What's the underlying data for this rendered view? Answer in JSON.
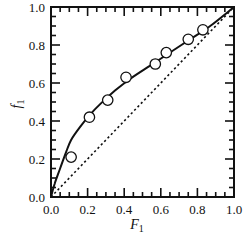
{
  "chart_data": {
    "type": "scatter",
    "title": "",
    "xlabel": "F1",
    "ylabel": "f1",
    "xlabel_main": "F",
    "xlabel_sub": "1",
    "ylabel_main": "f",
    "ylabel_sub": "1",
    "xlim": [
      0.0,
      1.0
    ],
    "ylim": [
      0.0,
      1.0
    ],
    "grid": false,
    "legend": null,
    "ticks": {
      "major_step": 0.2,
      "minor_step": 0.05,
      "direction": "in",
      "mirror": true
    },
    "x_tick_labels": [
      "0.0",
      "0.2",
      "0.4",
      "0.6",
      "0.8",
      "1.0"
    ],
    "y_tick_labels": [
      "0.0",
      "0.2",
      "0.4",
      "0.6",
      "0.8",
      "1.0"
    ],
    "series": [
      {
        "name": "Experimental data",
        "kind": "markers",
        "marker": "open-circle",
        "x": [
          0.11,
          0.21,
          0.31,
          0.41,
          0.57,
          0.63,
          0.75,
          0.83
        ],
        "y": [
          0.21,
          0.42,
          0.51,
          0.63,
          0.7,
          0.76,
          0.83,
          0.88
        ]
      },
      {
        "name": "Fitted composition curve",
        "kind": "line",
        "style": "solid",
        "x": [
          0.0,
          0.02,
          0.05,
          0.08,
          0.11,
          0.16,
          0.21,
          0.27,
          0.35,
          0.43,
          0.54,
          0.65,
          0.76,
          0.87,
          1.0
        ],
        "y": [
          0.0,
          0.07,
          0.15,
          0.23,
          0.3,
          0.37,
          0.43,
          0.49,
          0.56,
          0.62,
          0.69,
          0.76,
          0.83,
          0.9,
          1.0
        ]
      },
      {
        "name": "Ideal (azeotropic) line f1 = F1",
        "kind": "line",
        "style": "dotted",
        "x": [
          0.0,
          1.0
        ],
        "y": [
          0.0,
          1.0
        ]
      }
    ]
  },
  "colors": {
    "ink": "#111111",
    "background": "#ffffff"
  }
}
